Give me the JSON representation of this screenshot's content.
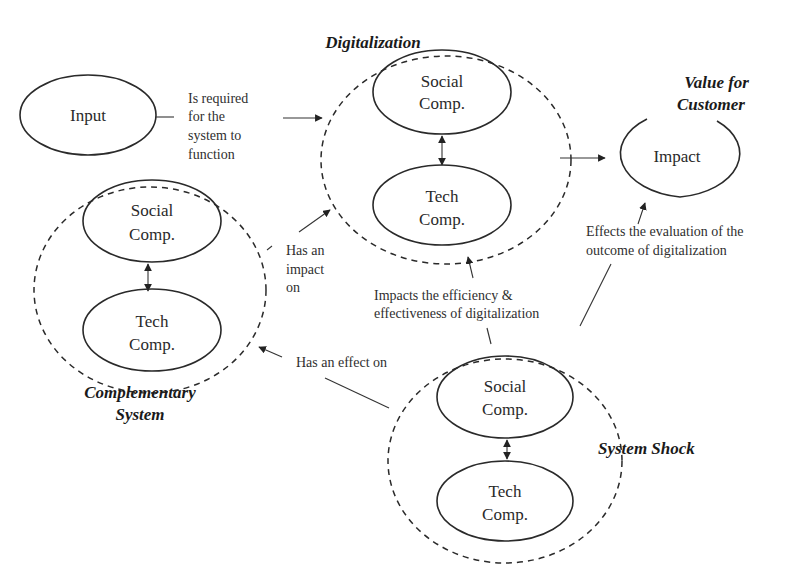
{
  "diagram": {
    "input": {
      "label": "Input"
    },
    "input_edge": {
      "lines": [
        "Is required",
        "for the",
        "system to",
        "function"
      ]
    },
    "digitalization": {
      "title": "Digitalization",
      "social": [
        "Social",
        "Comp."
      ],
      "tech": [
        "Tech",
        "Comp."
      ]
    },
    "value": {
      "title_lines": [
        "Value for",
        "Customer"
      ],
      "impact": "Impact"
    },
    "complementary": {
      "title_lines": [
        "Complementary",
        "System"
      ],
      "social": [
        "Social",
        "Comp."
      ],
      "tech": [
        "Tech",
        "Comp."
      ]
    },
    "system_shock": {
      "title": "System Shock",
      "social": [
        "Social",
        "Comp."
      ],
      "tech": [
        "Tech",
        "Comp."
      ]
    },
    "edges": {
      "has_impact_on": [
        "Has an",
        "impact",
        "on"
      ],
      "has_effect_on": "Has an effect on",
      "impacts_efficiency": [
        "Impacts the efficiency &",
        "effectiveness of digitalization"
      ],
      "effects_evaluation": [
        "Effects the evaluation of the",
        "outcome of digitalization"
      ]
    },
    "colors": {
      "stroke": "#2a2a2a",
      "background": "#ffffff"
    }
  }
}
